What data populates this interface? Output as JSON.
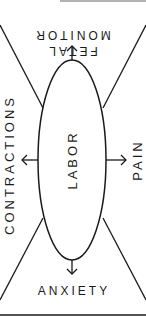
{
  "diagram": {
    "center": {
      "label": "LABOR"
    },
    "nodes": [
      {
        "id": "top",
        "line1": "MONITOR",
        "line2": "FETAL",
        "position": "top",
        "orientation": "upside-down"
      },
      {
        "id": "left",
        "label": "CONTRACTIONS",
        "position": "left",
        "orientation": "rotated-ccw"
      },
      {
        "id": "right",
        "label": "PAIN",
        "position": "right",
        "orientation": "rotated-ccw"
      },
      {
        "id": "bottom",
        "label": "ANXIETY",
        "position": "bottom",
        "orientation": "normal"
      }
    ],
    "colors": {
      "ink": "#1a1a1a",
      "background": "#ffffff",
      "top_rule": "#9a9a9a"
    }
  }
}
